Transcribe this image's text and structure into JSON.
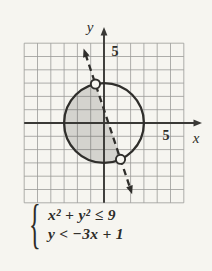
{
  "figure": {
    "axis_labels": {
      "x": "x",
      "y": "y"
    },
    "tick_labels": {
      "x": "5",
      "y": "5"
    }
  },
  "equations": {
    "brace": "{",
    "line1": "x² + y² ≤ 9",
    "line2": "y < −3x + 1"
  },
  "colors": {
    "paper": "#f6f5f0",
    "grid": "#9b9b98",
    "axis": "#3a3936",
    "curve": "#2f2e2b",
    "shade": "rgba(60,60,55,0.18)",
    "point_fill": "#f6f5f0",
    "text": "#2d2c28"
  },
  "chart_data": {
    "type": "line",
    "x_range": [
      -6,
      6
    ],
    "y_range": [
      -6,
      6
    ],
    "grid": true,
    "x_tick_label": 5,
    "y_tick_label": 5,
    "circle": {
      "cx": 0,
      "cy": 0,
      "r": 3,
      "boundary": "solid",
      "inequality": "x² + y² ≤ 9"
    },
    "line": {
      "slope": -3,
      "intercept": 1,
      "boundary": "dashed",
      "inequality": "y < −3x + 1"
    },
    "intersection_points": [
      {
        "x": -0.64,
        "y": 2.93,
        "open": true
      },
      {
        "x": 1.24,
        "y": -2.73,
        "open": true
      }
    ],
    "shaded_region": "points inside or on the circle that are below the dashed line (left of it)"
  }
}
